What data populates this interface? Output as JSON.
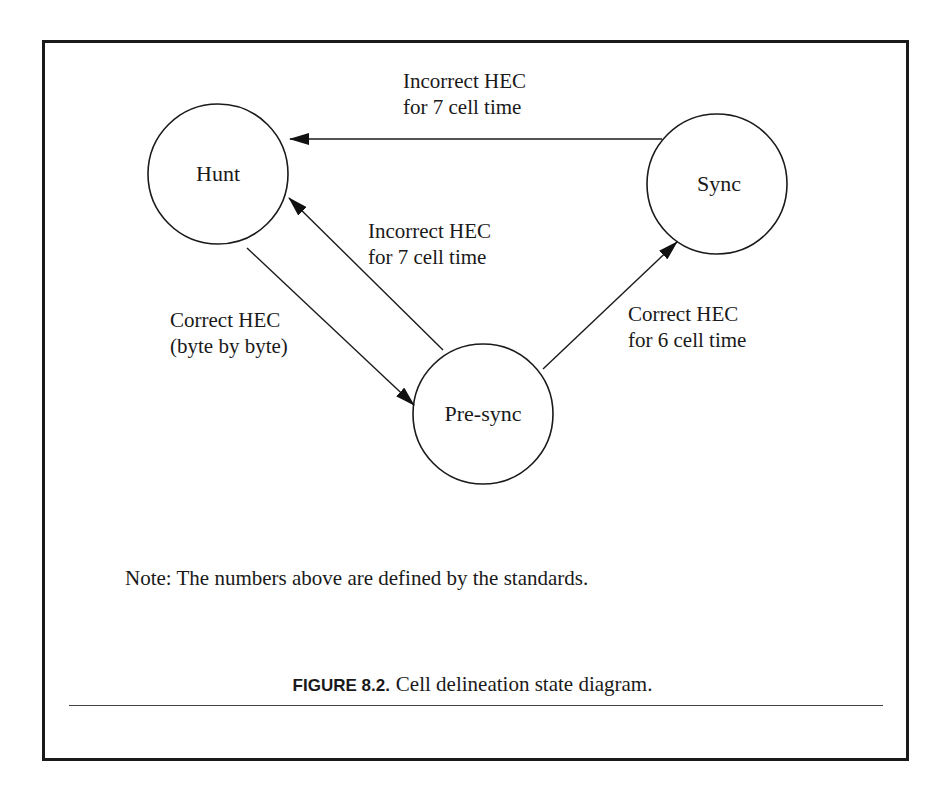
{
  "diagram": {
    "title": "Cell delineation state diagram",
    "states": [
      {
        "id": "hunt",
        "label": "Hunt"
      },
      {
        "id": "sync",
        "label": "Sync"
      },
      {
        "id": "presync",
        "label": "Pre-sync"
      }
    ],
    "transitions": [
      {
        "from": "sync",
        "to": "hunt",
        "label_line1": "Incorrect HEC",
        "label_line2": "for 7 cell time"
      },
      {
        "from": "presync",
        "to": "hunt",
        "label_line1": "Incorrect HEC",
        "label_line2": "for 7 cell time"
      },
      {
        "from": "hunt",
        "to": "presync",
        "label_line1": "Correct HEC",
        "label_line2": "(byte by byte)"
      },
      {
        "from": "presync",
        "to": "sync",
        "label_line1": "Correct HEC",
        "label_line2": "for 6 cell time"
      }
    ],
    "note": "Note: The numbers above are defined by the standards."
  },
  "caption": {
    "figure_number": "FIGURE 8.2.",
    "text": "Cell delineation state diagram."
  }
}
